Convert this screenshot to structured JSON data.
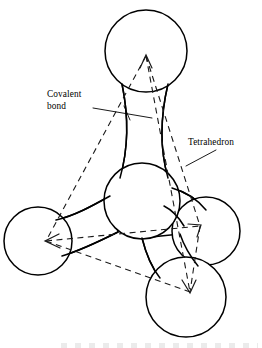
{
  "figure": {
    "type": "scientific-illustration",
    "background_color": "#ffffff",
    "line_color": "#000000",
    "dash_color": "#1a1a1a"
  },
  "labels": [
    {
      "id": "covalent-bond",
      "line1": "Covalent",
      "line2": "bond",
      "x": 47,
      "y": 93,
      "leader": "from text to the vertical bond neck"
    },
    {
      "id": "tetrahedron",
      "line1": "Tetrahedron",
      "line2": "",
      "x": 188,
      "y": 141,
      "leader": "from text down-left to tetrahedron edge"
    }
  ],
  "atoms": [
    {
      "id": "atom-top",
      "cx": 146,
      "cy": 51,
      "r": 41
    },
    {
      "id": "atom-center",
      "cx": 142,
      "cy": 201,
      "r": 38
    },
    {
      "id": "atom-bottom-left",
      "cx": 38,
      "cy": 241,
      "r": 34
    },
    {
      "id": "atom-right",
      "cx": 206,
      "cy": 231,
      "r": 34
    },
    {
      "id": "atom-bottom-front",
      "cx": 186,
      "cy": 297,
      "r": 40
    }
  ],
  "bonds": [
    {
      "id": "bond-top",
      "from": "atom-center",
      "to": "atom-top"
    },
    {
      "id": "bond-left",
      "from": "atom-center",
      "to": "atom-bottom-left"
    },
    {
      "id": "bond-right",
      "from": "atom-center",
      "to": "atom-right"
    },
    {
      "id": "bond-front",
      "from": "atom-center",
      "to": "atom-bottom-front"
    }
  ],
  "tetrahedron": {
    "vertices": [
      {
        "id": "vertex-top",
        "x": 146,
        "y": 56
      },
      {
        "id": "vertex-left",
        "x": 46,
        "y": 241
      },
      {
        "id": "vertex-right",
        "x": 200,
        "y": 226
      },
      {
        "id": "vertex-front",
        "x": 190,
        "y": 292
      }
    ],
    "edge_count": 6,
    "style": "dashed",
    "arrowheads_at": [
      "vertex-top",
      "vertex-left",
      "vertex-right",
      "vertex-front"
    ]
  }
}
